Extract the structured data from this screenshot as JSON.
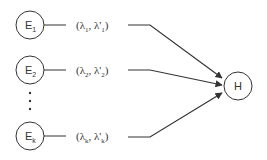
{
  "diagram": {
    "sources": [
      {
        "id": "E1",
        "label": "E",
        "sub": "1",
        "edge_label": {
          "a": "λ",
          "a_sub": "1",
          "b": "λ'",
          "b_sub": "1"
        }
      },
      {
        "id": "E2",
        "label": "E",
        "sub": "2",
        "edge_label": {
          "a": "λ",
          "a_sub": "2",
          "b": "λ'",
          "b_sub": "2"
        }
      },
      {
        "id": "Ek",
        "label": "E",
        "sub": "k",
        "edge_label": {
          "a": "λ",
          "a_sub": "k",
          "b": "λ'",
          "b_sub": "k"
        }
      }
    ],
    "ellipsis": "⋮",
    "target": {
      "id": "H",
      "label": "H"
    },
    "colors": {
      "stroke": "#333333",
      "background": "#ffffff"
    }
  }
}
